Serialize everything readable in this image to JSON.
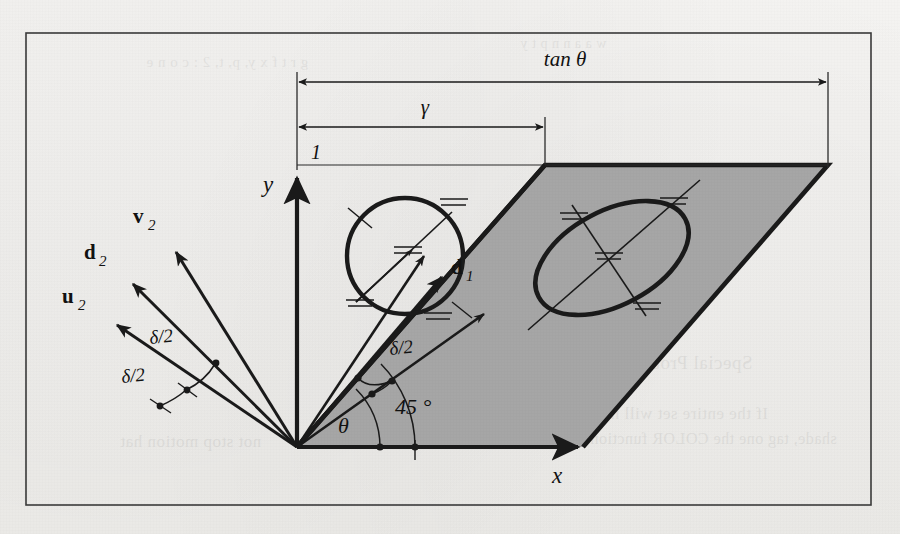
{
  "figure": {
    "frame": {
      "x": 26,
      "y": 33,
      "width": 845,
      "height": 472
    },
    "colors": {
      "ink": "#1a1a1a",
      "thin_ink": "#2b2b2b",
      "shaded_region": "#a6a6a6",
      "page": "#f3f2f1",
      "frame_border": "#3a3a3a"
    }
  },
  "axes": {
    "origin": {
      "x": 297,
      "y": 447
    },
    "x_label": "x",
    "y_label": "y",
    "x_label_pos": {
      "x": 557,
      "y": 480
    },
    "y_label_pos": {
      "x": 268,
      "y": 190
    },
    "x_arrow_tip": {
      "x": 585,
      "y": 447
    },
    "y_arrow_tip": {
      "x": 297,
      "y": 170
    }
  },
  "dimensions": [
    {
      "label": "tan θ",
      "label_pos": {
        "x": 565,
        "y": 62
      },
      "y": 82,
      "x_start": 297,
      "x_end": 828
    },
    {
      "label": "γ",
      "label_pos": {
        "x": 425,
        "y": 110
      },
      "y": 127,
      "x_start": 297,
      "x_end": 545
    },
    {
      "label": "1",
      "label_pos": {
        "x": 311,
        "y": 152
      },
      "y": 165,
      "x_start": 297,
      "x_end": 828
    }
  ],
  "vectors_left": [
    {
      "name": "v2",
      "label": "v",
      "subscript": "2",
      "tip": {
        "x": 170,
        "y": 246
      },
      "label_pos": {
        "x": 140,
        "y": 216
      }
    },
    {
      "name": "d2",
      "label": "d",
      "subscript": "2",
      "tip": {
        "x": 126,
        "y": 278
      },
      "label_pos": {
        "x": 92,
        "y": 252
      }
    },
    {
      "name": "u2",
      "label": "u",
      "subscript": "2",
      "tip": {
        "x": 110,
        "y": 320
      },
      "label_pos": {
        "x": 72,
        "y": 296
      }
    }
  ],
  "vectors_right": [
    {
      "name": "d1",
      "label": "d",
      "subscript": "1",
      "tip": {
        "x": 448,
        "y": 281
      },
      "label_pos": {
        "x": 455,
        "y": 268
      }
    },
    {
      "name": "u1-upper",
      "label": "",
      "subscript": "",
      "tip": {
        "x": 430,
        "y": 260
      },
      "label_pos": {
        "x": 0,
        "y": 0
      }
    },
    {
      "name": "v1-lower",
      "label": "",
      "subscript": "",
      "tip": {
        "x": 490,
        "y": 318
      },
      "label_pos": {
        "x": 0,
        "y": 0
      }
    }
  ],
  "angle_labels": [
    {
      "name": "delta-over-2-left-upper",
      "text": "δ/2",
      "x": 150,
      "y": 344
    },
    {
      "name": "delta-over-2-left-lower",
      "text": "δ/2",
      "x": 126,
      "y": 381
    },
    {
      "name": "delta-over-2-center",
      "text": "δ/2",
      "x": 398,
      "y": 350
    },
    {
      "name": "theta",
      "text": "θ",
      "x": 345,
      "y": 428
    },
    {
      "name": "forty-five-degrees",
      "text": "45 °",
      "x": 412,
      "y": 410
    }
  ],
  "shapes": {
    "circle": {
      "cx": 405,
      "cy": 256,
      "r": 58,
      "name": "unit-circle"
    },
    "ellipse": {
      "cx": 612,
      "cy": 258,
      "rx": 82,
      "ry": 46,
      "rotation": -28,
      "name": "sheared-ellipse"
    },
    "parallelogram": {
      "name": "shaded-parallelogram",
      "points": "297,447 545,165 828,165 583,447"
    }
  },
  "ghost_text": [
    {
      "text": "Special Problems",
      "x": 612,
      "y": 352,
      "size": 19
    },
    {
      "text": "If the entire set will not",
      "x": 596,
      "y": 404,
      "size": 17
    },
    {
      "text": "shade, tag one the COLOR function",
      "x": 590,
      "y": 430,
      "size": 16
    },
    {
      "text": "not stop motion hat",
      "x": 120,
      "y": 432,
      "size": 17
    },
    {
      "text": "g r t f x y, p, t, 2 : c o n e",
      "x": 146,
      "y": 54,
      "size": 15
    },
    {
      "text": "w a a n n p t y",
      "x": 520,
      "y": 36,
      "size": 14
    }
  ]
}
